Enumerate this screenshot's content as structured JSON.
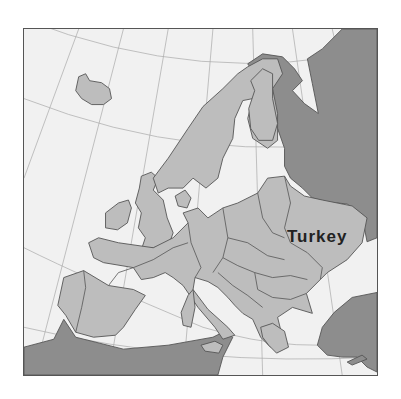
{
  "map": {
    "title": "",
    "region": "Europe",
    "labels": [
      {
        "text": "Turkey",
        "position": "over Ukraine region"
      }
    ],
    "colors": {
      "sea": "#f1f1f1",
      "highlight_land": "#bdbdbd",
      "other_land": "#8d8d8d",
      "borders": "#555555",
      "graticule": "#a8a8a8",
      "label": "#222222"
    }
  }
}
